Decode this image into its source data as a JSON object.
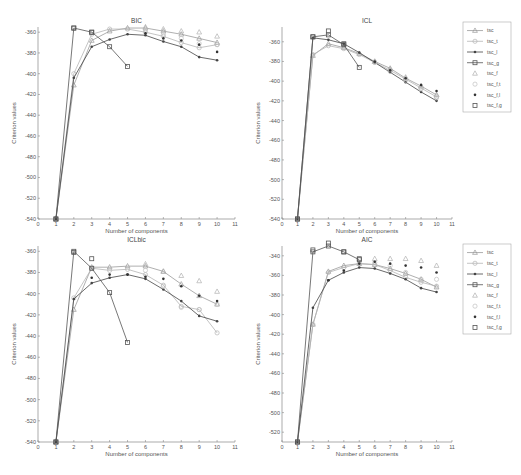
{
  "figure": {
    "series_legend": [
      {
        "key": "tsc",
        "label": "tsc",
        "color": "#9a9a9a",
        "marker": "triangle",
        "line": true
      },
      {
        "key": "tsc_t",
        "label": "tsc_t",
        "color": "#b5b5b5",
        "marker": "circle",
        "line": true
      },
      {
        "key": "tsc_l",
        "label": "tsc_l",
        "color": "#444444",
        "marker": "dot",
        "line": true
      },
      {
        "key": "tsc_g",
        "label": "tsc_g",
        "color": "#555555",
        "marker": "square",
        "line": true
      },
      {
        "key": "tsc_f",
        "label": "tsc_f",
        "color": "#b0b0b0",
        "marker": "triangle",
        "line": false
      },
      {
        "key": "tsc_ft",
        "label": "tsc_f,t",
        "color": "#c0c0c0",
        "marker": "circle",
        "line": false
      },
      {
        "key": "tsc_fl",
        "label": "tsc_f,l",
        "color": "#333333",
        "marker": "dot",
        "line": false
      },
      {
        "key": "tsc_fg",
        "label": "tsc_f,g",
        "color": "#555555",
        "marker": "square",
        "line": false
      }
    ]
  },
  "chart_data": [
    {
      "type": "line",
      "title": "BIC",
      "xlabel": "Number of components",
      "ylabel": "Criterion values",
      "xlim": [
        0,
        11
      ],
      "ylim": [
        -540,
        -355
      ],
      "xticks": [
        0,
        1,
        2,
        3,
        4,
        5,
        6,
        7,
        8,
        9,
        10,
        11
      ],
      "yticks": [
        -540,
        -520,
        -500,
        -480,
        -460,
        -440,
        -420,
        -400,
        -380,
        -360
      ],
      "grid": false,
      "legend_position": "outside-right",
      "series": [
        {
          "name": "tsc",
          "x": [
            1,
            2,
            3,
            4,
            5,
            6,
            7,
            8,
            9,
            10
          ],
          "values": [
            -540,
            -411,
            -368,
            -359,
            -356,
            -356,
            -359,
            -362,
            -366,
            -370
          ]
        },
        {
          "name": "tsc_t",
          "x": [
            1,
            2,
            3,
            4,
            5,
            6,
            7,
            8,
            9,
            10
          ],
          "values": [
            -540,
            -400,
            -362,
            -357,
            -357,
            -360,
            -364,
            -370,
            -375,
            -372
          ]
        },
        {
          "name": "tsc_l",
          "x": [
            1,
            2,
            3,
            4,
            5,
            6,
            7,
            8,
            9,
            10
          ],
          "values": [
            -540,
            -404,
            -374,
            -367,
            -362,
            -363,
            -369,
            -374,
            -384,
            -387
          ]
        },
        {
          "name": "tsc_g",
          "x": [
            1,
            2,
            3,
            4,
            5
          ],
          "values": [
            -540,
            -356,
            -360,
            -374,
            -393
          ]
        },
        {
          "name": "tsc_f",
          "x": [
            6,
            7,
            8,
            9,
            10
          ],
          "values": [
            -355,
            -357,
            -359,
            -360,
            -364
          ]
        },
        {
          "name": "tsc_f,t",
          "x": [
            6,
            7,
            8,
            9,
            10
          ],
          "values": [
            -358,
            -362,
            -366,
            -371,
            -372
          ]
        },
        {
          "name": "tsc_f,l",
          "x": [
            6,
            7,
            8,
            9,
            10
          ],
          "values": [
            -361,
            -366,
            -368,
            -372,
            -379
          ]
        },
        {
          "name": "tsc_f,g",
          "x": [
            1,
            2,
            3
          ],
          "values": [
            -540,
            -356,
            -360
          ]
        }
      ]
    },
    {
      "type": "line",
      "title": "ICL",
      "xlabel": "Number of components",
      "ylabel": "Criterion values",
      "xlim": [
        0,
        11
      ],
      "ylim": [
        -540,
        -345
      ],
      "xticks": [
        0,
        1,
        2,
        3,
        4,
        5,
        6,
        7,
        8,
        9,
        10,
        11
      ],
      "yticks": [
        -540,
        -520,
        -500,
        -480,
        -460,
        -440,
        -420,
        -400,
        -380,
        -360
      ],
      "grid": false,
      "legend_position": "outside-right",
      "series": [
        {
          "name": "tsc",
          "x": [
            1,
            2,
            3,
            4,
            5,
            6,
            7,
            8,
            9,
            10
          ],
          "values": [
            -540,
            -374,
            -362,
            -366,
            -372,
            -380,
            -387,
            -397,
            -405,
            -414
          ]
        },
        {
          "name": "tsc_t",
          "x": [
            1,
            2,
            3,
            4,
            5,
            6,
            7,
            8,
            9,
            10
          ],
          "values": [
            -540,
            -373,
            -364,
            -367,
            -373,
            -381,
            -389,
            -398,
            -407,
            -416
          ]
        },
        {
          "name": "tsc_l",
          "x": [
            1,
            2,
            3,
            4,
            5,
            6,
            7,
            8,
            9,
            10
          ],
          "values": [
            -540,
            -356,
            -358,
            -362,
            -371,
            -381,
            -391,
            -401,
            -411,
            -420
          ]
        },
        {
          "name": "tsc_g",
          "x": [
            1,
            2,
            3,
            4,
            5
          ],
          "values": [
            -540,
            -355,
            -353,
            -363,
            -386
          ]
        },
        {
          "name": "tsc_f",
          "x": [
            6,
            7,
            8,
            9,
            10
          ],
          "values": [
            -380,
            -388,
            -396,
            -405,
            -414
          ]
        },
        {
          "name": "tsc_f,t",
          "x": [
            6,
            7,
            8,
            9,
            10
          ],
          "values": [
            -381,
            -390,
            -399,
            -408,
            -417
          ]
        },
        {
          "name": "tsc_f,l",
          "x": [
            6,
            7,
            8,
            9,
            10
          ],
          "values": [
            -380,
            -389,
            -397,
            -404,
            -410
          ]
        },
        {
          "name": "tsc_f,g",
          "x": [
            1,
            2,
            3,
            4
          ],
          "values": [
            -540,
            -355,
            -349,
            -362
          ]
        }
      ]
    },
    {
      "type": "line",
      "title": "ICLbic",
      "xlabel": "Number of components",
      "ylabel": "Criterion values",
      "xlim": [
        0,
        11
      ],
      "ylim": [
        -540,
        -355
      ],
      "xticks": [
        0,
        1,
        2,
        3,
        4,
        5,
        6,
        7,
        8,
        9,
        10,
        11
      ],
      "yticks": [
        -540,
        -520,
        -500,
        -480,
        -460,
        -440,
        -420,
        -400,
        -380,
        -360
      ],
      "grid": false,
      "legend_position": "none",
      "series": [
        {
          "name": "tsc",
          "x": [
            1,
            2,
            3,
            4,
            5,
            6,
            7,
            8,
            9,
            10
          ],
          "values": [
            -540,
            -415,
            -375,
            -375,
            -374,
            -374,
            -379,
            -391,
            -402,
            -410
          ]
        },
        {
          "name": "tsc_t",
          "x": [
            1,
            2,
            3,
            4,
            5,
            6,
            7,
            8,
            9,
            10
          ],
          "values": [
            -540,
            -404,
            -376,
            -378,
            -377,
            -382,
            -392,
            -412,
            -415,
            -437
          ]
        },
        {
          "name": "tsc_l",
          "x": [
            1,
            2,
            3,
            4,
            5,
            6,
            7,
            8,
            9,
            10
          ],
          "values": [
            -540,
            -405,
            -390,
            -385,
            -382,
            -386,
            -396,
            -407,
            -421,
            -426
          ]
        },
        {
          "name": "tsc_g",
          "x": [
            1,
            2,
            3,
            4,
            5
          ],
          "values": [
            -540,
            -360,
            -376,
            -399,
            -446
          ]
        },
        {
          "name": "tsc_f",
          "x": [
            6,
            7,
            8,
            9,
            10
          ],
          "values": [
            -372,
            -379,
            -383,
            -388,
            -398
          ]
        },
        {
          "name": "tsc_f,t",
          "x": [
            6,
            7,
            8,
            9,
            10
          ],
          "values": [
            -378,
            -393,
            -413,
            -415,
            -410
          ]
        },
        {
          "name": "tsc_f,l",
          "x": [
            3,
            4,
            5,
            6,
            7,
            8,
            9,
            10
          ],
          "values": [
            -385,
            -382,
            -382,
            -384,
            -386,
            -393,
            -402,
            -407
          ]
        },
        {
          "name": "tsc_f,g",
          "x": [
            1,
            2,
            3
          ],
          "values": [
            -540,
            -361,
            -367
          ]
        }
      ]
    },
    {
      "type": "line",
      "title": "AIC",
      "xlabel": "Number of components",
      "ylabel": "Criterion values",
      "xlim": [
        0,
        11
      ],
      "ylim": [
        -530,
        -330
      ],
      "xticks": [
        0,
        1,
        2,
        3,
        4,
        5,
        6,
        7,
        8,
        9,
        10,
        11
      ],
      "yticks": [
        -520,
        -500,
        -480,
        -460,
        -440,
        -420,
        -400,
        -380,
        -360,
        -340
      ],
      "grid": false,
      "legend_position": "outside-right",
      "series": [
        {
          "name": "tsc",
          "x": [
            1,
            2,
            3,
            4,
            5,
            6,
            7,
            8,
            9,
            10
          ],
          "values": [
            -530,
            -410,
            -356,
            -350,
            -348,
            -349,
            -353,
            -358,
            -364,
            -372
          ]
        },
        {
          "name": "tsc_t",
          "x": [
            1,
            2,
            3,
            4,
            5,
            6,
            7,
            8,
            9,
            10
          ],
          "values": [
            -530,
            -410,
            -357,
            -352,
            -348,
            -349,
            -355,
            -362,
            -367,
            -371
          ]
        },
        {
          "name": "tsc_l",
          "x": [
            1,
            2,
            3,
            4,
            5,
            6,
            7,
            8,
            9,
            10
          ],
          "values": [
            -530,
            -393,
            -365,
            -357,
            -352,
            -353,
            -358,
            -364,
            -373,
            -377
          ]
        },
        {
          "name": "tsc_g",
          "x": [
            1,
            2,
            3,
            4,
            5
          ],
          "values": [
            -530,
            -336,
            -330,
            -336,
            -344
          ]
        },
        {
          "name": "tsc_f",
          "x": [
            6,
            7,
            8,
            9,
            10
          ],
          "values": [
            -343,
            -343,
            -343,
            -345,
            -350
          ]
        },
        {
          "name": "tsc_f,t",
          "x": [
            6,
            7,
            8,
            9,
            10
          ],
          "values": [
            -347,
            -350,
            -357,
            -364,
            -364
          ]
        },
        {
          "name": "tsc_f,l",
          "x": [
            3,
            4,
            5,
            6,
            7,
            8,
            9,
            10
          ],
          "values": [
            -365,
            -355,
            -348,
            -346,
            -348,
            -350,
            -352,
            -357
          ]
        },
        {
          "name": "tsc_f,g",
          "x": [
            1,
            2,
            3,
            4,
            5
          ],
          "values": [
            -530,
            -334,
            -327,
            -336,
            -343
          ]
        }
      ]
    }
  ],
  "layout": {
    "panels": [
      {
        "left": 38,
        "top": 27,
        "width": 197,
        "height": 192
      },
      {
        "left": 282,
        "top": 27,
        "width": 170,
        "height": 192
      },
      {
        "left": 38,
        "top": 246,
        "width": 197,
        "height": 196
      },
      {
        "left": 282,
        "top": 246,
        "width": 170,
        "height": 196
      }
    ],
    "legends": [
      {
        "left": 463,
        "top": 22,
        "width": 48,
        "height": 90
      },
      {
        "left": 463,
        "top": 244,
        "width": 48,
        "height": 90
      }
    ]
  }
}
